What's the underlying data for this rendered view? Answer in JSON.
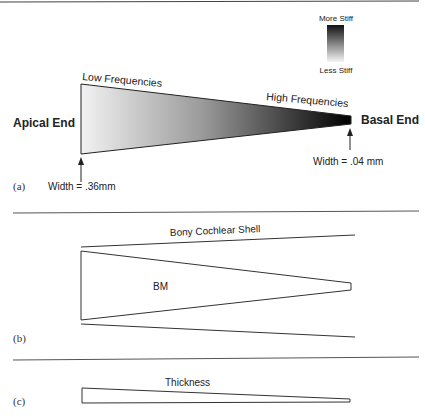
{
  "panel_a": {
    "label": "(a)",
    "stiffness_top": "More Stiff",
    "stiffness_bottom": "Less Stiff",
    "low_freq": "Low Frequencies",
    "high_freq": "High Frequencies",
    "apical": "Apical End",
    "basal": "Basal End",
    "width_apical": "Width = .36mm",
    "width_basal": "Width = .04 mm"
  },
  "panel_b": {
    "label": "(b)",
    "shell": "Bony Cochlear Shell",
    "bm": "BM"
  },
  "panel_c": {
    "label": "(c)",
    "thickness": "Thickness"
  },
  "colors": {
    "line": "#333333",
    "gradient_light": "#f2f2f2",
    "gradient_dark": "#000000"
  }
}
